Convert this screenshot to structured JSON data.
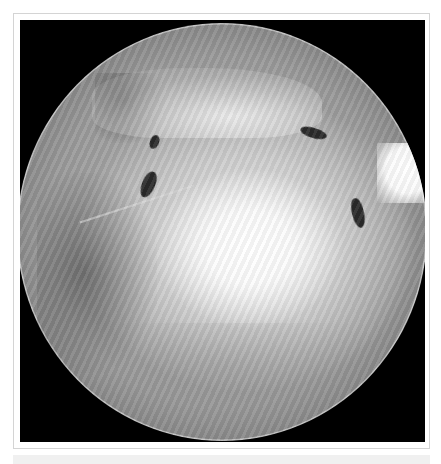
{
  "figure": {
    "colors": {
      "frame_border": "#d4d4d4",
      "viewport_background": "#000000",
      "page_background": "#ffffff",
      "bottom_strip": "#f0f0f0"
    }
  }
}
